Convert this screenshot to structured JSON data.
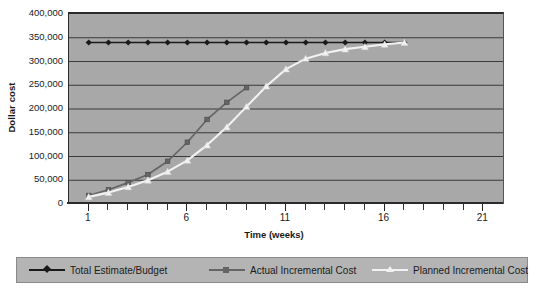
{
  "chart_data": {
    "type": "line",
    "title": "",
    "xlabel": "Time (weeks)",
    "ylabel": "Dollar cost",
    "xlim": [
      0,
      22
    ],
    "ylim": [
      0,
      400000
    ],
    "yticks": [
      0,
      50000,
      100000,
      150000,
      200000,
      250000,
      300000,
      350000,
      400000
    ],
    "ytick_labels": [
      "0",
      "50,000",
      "100,000",
      "150,000",
      "200,000",
      "250,000",
      "300,000",
      "350,000",
      "400,000"
    ],
    "xticks": [
      1,
      6,
      11,
      16,
      21
    ],
    "xtick_labels": [
      "1",
      "6",
      "11",
      "16",
      "21"
    ],
    "x_minor_ticks": [
      1,
      2,
      3,
      4,
      5,
      6,
      7,
      8,
      9,
      10,
      11,
      12,
      13,
      14,
      15,
      16,
      17,
      18,
      19,
      20,
      21
    ],
    "grid": "horizontal",
    "legend_position": "bottom",
    "plot_background": "#a8a8a8",
    "series": [
      {
        "name": "Total Estimate/Budget",
        "color": "#1a1a1a",
        "marker": "diamond",
        "x": [
          1,
          2,
          3,
          4,
          5,
          6,
          7,
          8,
          9,
          10,
          11,
          12,
          13,
          14,
          15,
          16,
          17
        ],
        "values": [
          340000,
          340000,
          340000,
          340000,
          340000,
          340000,
          340000,
          340000,
          340000,
          340000,
          340000,
          340000,
          340000,
          340000,
          340000,
          340000,
          340000
        ]
      },
      {
        "name": "Actual Incremental Cost",
        "color": "#656565",
        "marker": "square",
        "x": [
          1,
          2,
          3,
          4,
          5,
          6,
          7,
          8,
          9
        ],
        "values": [
          18000,
          30000,
          45000,
          62000,
          90000,
          130000,
          178000,
          214000,
          245000
        ]
      },
      {
        "name": "Planned Incremental Cost",
        "color": "#f2f2f2",
        "marker": "triangle",
        "x": [
          1,
          2,
          3,
          4,
          5,
          6,
          7,
          8,
          9,
          10,
          11,
          12,
          13,
          14,
          15,
          16,
          17
        ],
        "values": [
          15000,
          24000,
          36000,
          50000,
          68000,
          92000,
          124000,
          162000,
          205000,
          248000,
          284000,
          306000,
          318000,
          326000,
          331000,
          336000,
          340000
        ]
      }
    ]
  }
}
